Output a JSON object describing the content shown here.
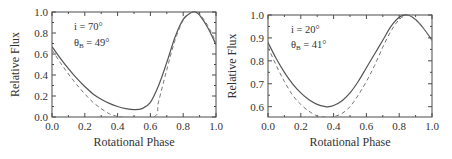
{
  "chart_data": [
    {
      "type": "line",
      "xlabel": "Rotational Phase",
      "ylabel": "Relative Flux",
      "xlim": [
        0.0,
        1.0
      ],
      "ylim": [
        0.0,
        1.0
      ],
      "xticks": [
        "0.0",
        "0.2",
        "0.4",
        "0.6",
        "0.8",
        "1.0"
      ],
      "yticks": [
        "0.0",
        "0.2",
        "0.4",
        "0.6",
        "0.8",
        "1.0"
      ],
      "ytick_values": [
        0.0,
        0.2,
        0.4,
        0.6,
        0.8,
        1.0
      ],
      "annotations": [
        "i = 70°",
        "θB = 49°"
      ],
      "annotation_parts": {
        "line1": "i = 70°",
        "line2_sym": "θ",
        "line2_sub": "B",
        "line2_rest": " = 49°"
      },
      "series": [
        {
          "name": "model",
          "style": "solid",
          "x": [
            0.0,
            0.05,
            0.1,
            0.15,
            0.2,
            0.25,
            0.3,
            0.35,
            0.4,
            0.45,
            0.5,
            0.55,
            0.6,
            0.65,
            0.7,
            0.75,
            0.8,
            0.85,
            0.875,
            0.9,
            0.95,
            1.0
          ],
          "y": [
            0.67,
            0.56,
            0.46,
            0.37,
            0.29,
            0.22,
            0.17,
            0.13,
            0.1,
            0.08,
            0.07,
            0.08,
            0.14,
            0.3,
            0.52,
            0.76,
            0.93,
            0.995,
            1.0,
            0.97,
            0.85,
            0.69
          ]
        },
        {
          "name": "observed",
          "style": "dashed",
          "x": [
            0.0,
            0.05,
            0.1,
            0.15,
            0.2,
            0.25,
            0.3,
            0.35,
            0.4,
            0.42,
            0.62,
            0.65,
            0.7,
            0.75,
            0.8,
            0.85,
            0.875,
            0.9,
            0.95,
            1.0
          ],
          "y": [
            0.64,
            0.52,
            0.41,
            0.31,
            0.22,
            0.14,
            0.08,
            0.03,
            0.005,
            0.0,
            0.0,
            0.15,
            0.45,
            0.73,
            0.92,
            0.995,
            1.0,
            0.98,
            0.87,
            0.71
          ]
        }
      ]
    },
    {
      "type": "line",
      "xlabel": "Rotational Phase",
      "ylabel": "Relative Flux",
      "xlim": [
        0.0,
        1.0
      ],
      "ylim": [
        0.555,
        1.0
      ],
      "xticks": [
        "0.0",
        "0.2",
        "0.4",
        "0.6",
        "0.8",
        "1.0"
      ],
      "yticks": [
        "0.6",
        "0.7",
        "0.8",
        "0.9",
        "1.0"
      ],
      "ytick_values": [
        0.6,
        0.7,
        0.8,
        0.9,
        1.0
      ],
      "annotations": [
        "i = 20°",
        "θB = 41°"
      ],
      "annotation_parts": {
        "line1": "i = 20°",
        "line2_sym": "θ",
        "line2_sub": "B",
        "line2_rest": " = 41°"
      },
      "series": [
        {
          "name": "model",
          "style": "solid",
          "x": [
            0.0,
            0.05,
            0.1,
            0.15,
            0.2,
            0.25,
            0.3,
            0.35,
            0.37,
            0.4,
            0.45,
            0.5,
            0.55,
            0.6,
            0.65,
            0.7,
            0.75,
            0.8,
            0.85,
            0.9,
            0.95,
            1.0
          ],
          "y": [
            0.88,
            0.81,
            0.75,
            0.7,
            0.66,
            0.63,
            0.61,
            0.6,
            0.6,
            0.605,
            0.625,
            0.66,
            0.71,
            0.77,
            0.83,
            0.89,
            0.95,
            0.99,
            1.0,
            0.98,
            0.94,
            0.89
          ],
          "y_min": 0.6
        },
        {
          "name": "observed",
          "style": "dashed",
          "x": [
            0.0,
            0.05,
            0.1,
            0.15,
            0.2,
            0.25,
            0.3,
            0.35,
            0.37,
            0.4,
            0.45,
            0.5,
            0.55,
            0.6,
            0.65,
            0.7,
            0.75,
            0.8,
            0.85,
            0.9,
            0.95,
            1.0
          ],
          "y": [
            0.86,
            0.78,
            0.71,
            0.65,
            0.61,
            0.58,
            0.56,
            0.555,
            0.553,
            0.556,
            0.57,
            0.6,
            0.65,
            0.71,
            0.78,
            0.86,
            0.93,
            0.98,
            1.0,
            0.98,
            0.94,
            0.89
          ]
        }
      ]
    }
  ]
}
